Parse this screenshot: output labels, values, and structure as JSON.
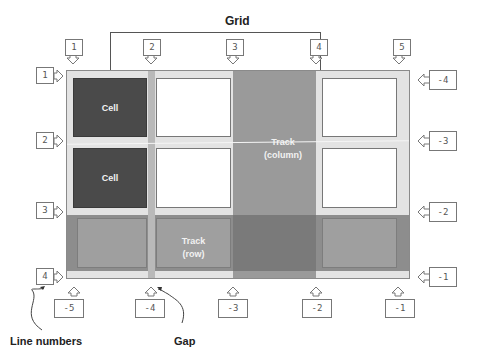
{
  "diagram": {
    "title": "Grid",
    "cells": [
      {
        "label": "Cell"
      },
      {
        "label": "Cell"
      }
    ],
    "column_track": {
      "line1": "Track",
      "line2": "(column)"
    },
    "row_track": {
      "line1": "Track",
      "line2": "(row)"
    },
    "captions": {
      "line_numbers": "Line numbers",
      "gap": "Gap"
    },
    "top_column_lines": [
      "1",
      "2",
      "3",
      "4",
      "5"
    ],
    "bottom_column_lines": [
      "-5",
      "-4",
      "-3",
      "-2",
      "-1"
    ],
    "left_row_lines": [
      "1",
      "2",
      "3",
      "4"
    ],
    "right_row_lines": [
      "-4",
      "-3",
      "-2",
      "-1"
    ],
    "colors": {
      "grid_background": "#e3e3e3",
      "cell_dark": "#4a4a4a",
      "track": "#9a9a9a",
      "track_intersection": "#7a7a7a",
      "gap": "#b9b9b9"
    }
  }
}
